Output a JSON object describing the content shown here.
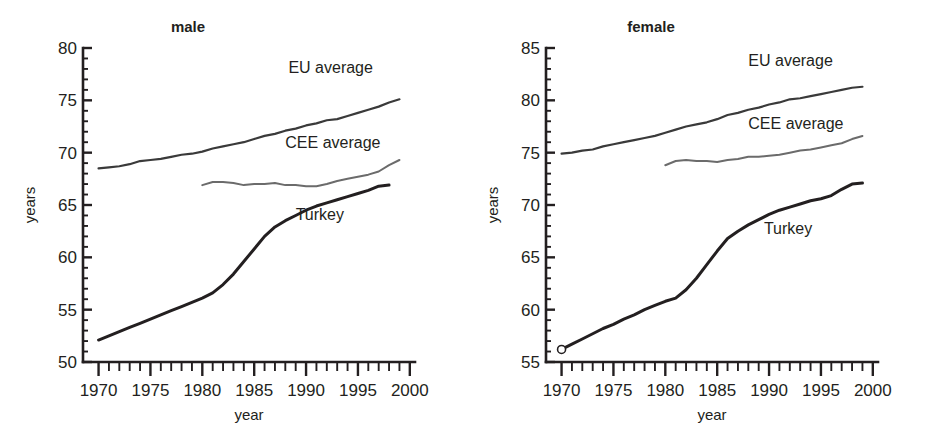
{
  "figure": {
    "background": "#ffffff",
    "ink": "#231f20"
  },
  "chart_data": [
    {
      "type": "line",
      "title": "male",
      "xlabel": "year",
      "ylabel": "years",
      "xlim": [
        1968.5,
        2000.5
      ],
      "ylim": [
        50,
        80
      ],
      "x_ticks_major": [
        1970,
        1975,
        1980,
        1985,
        1990,
        1995,
        2000
      ],
      "x_tick_labels": [
        "1970",
        "1975",
        "1980",
        "1985",
        "1990",
        "1995",
        "2000"
      ],
      "x_tick_minor_step": 1,
      "y_ticks_major": [
        50,
        55,
        60,
        65,
        70,
        75,
        80
      ],
      "y_tick_labels": [
        "50",
        "55",
        "60",
        "65",
        "70",
        "75",
        "80"
      ],
      "y_tick_minor_step": 1,
      "grid": false,
      "legend_position": "inline-annotations",
      "series": [
        {
          "name": "EU average",
          "color": "#3a3a3a",
          "width": 2.2,
          "label_x": 1988.3,
          "label_y": 77.6,
          "x": [
            1970,
            1971,
            1972,
            1973,
            1974,
            1975,
            1976,
            1977,
            1978,
            1979,
            1980,
            1981,
            1982,
            1983,
            1984,
            1985,
            1986,
            1987,
            1988,
            1989,
            1990,
            1991,
            1992,
            1993,
            1994,
            1995,
            1996,
            1997,
            1998,
            1999
          ],
          "values": [
            68.5,
            68.6,
            68.7,
            68.9,
            69.2,
            69.3,
            69.4,
            69.6,
            69.8,
            69.9,
            70.1,
            70.4,
            70.6,
            70.8,
            71.0,
            71.3,
            71.6,
            71.8,
            72.1,
            72.3,
            72.6,
            72.8,
            73.1,
            73.2,
            73.5,
            73.8,
            74.1,
            74.4,
            74.8,
            75.1
          ]
        },
        {
          "name": "CEE average",
          "color": "#6b6b6b",
          "width": 2.0,
          "label_x": 1988.0,
          "label_y": 70.4,
          "x": [
            1980,
            1981,
            1982,
            1983,
            1984,
            1985,
            1986,
            1987,
            1988,
            1989,
            1990,
            1991,
            1992,
            1993,
            1994,
            1995,
            1996,
            1997,
            1998,
            1999
          ],
          "values": [
            66.9,
            67.2,
            67.2,
            67.1,
            66.9,
            67.0,
            67.0,
            67.1,
            66.9,
            66.9,
            66.8,
            66.8,
            67.0,
            67.3,
            67.5,
            67.7,
            67.9,
            68.2,
            68.8,
            69.3
          ]
        },
        {
          "name": "Turkey",
          "color": "#231f20",
          "width": 3.0,
          "label_x": 1989.0,
          "label_y": 63.6,
          "x": [
            1970,
            1971,
            1972,
            1973,
            1974,
            1975,
            1976,
            1977,
            1978,
            1979,
            1980,
            1981,
            1982,
            1983,
            1984,
            1985,
            1986,
            1987,
            1988,
            1989,
            1990,
            1991,
            1992,
            1993,
            1994,
            1995,
            1996,
            1997,
            1998
          ],
          "values": [
            52.1,
            52.5,
            52.9,
            53.3,
            53.7,
            54.1,
            54.5,
            54.9,
            55.3,
            55.7,
            56.1,
            56.6,
            57.4,
            58.4,
            59.6,
            60.8,
            62.0,
            62.9,
            63.5,
            64.0,
            64.5,
            64.9,
            65.2,
            65.5,
            65.8,
            66.1,
            66.4,
            66.8,
            66.9
          ]
        }
      ]
    },
    {
      "type": "line",
      "title": "female",
      "xlabel": "year",
      "ylabel": "years",
      "xlim": [
        1968.5,
        2000.5
      ],
      "ylim": [
        55,
        85
      ],
      "x_ticks_major": [
        1970,
        1975,
        1980,
        1985,
        1990,
        1995,
        2000
      ],
      "x_tick_labels": [
        "1970",
        "1975",
        "1980",
        "1985",
        "1990",
        "1995",
        "2000"
      ],
      "x_tick_minor_step": 1,
      "y_ticks_major": [
        55,
        60,
        65,
        70,
        75,
        80,
        85
      ],
      "y_tick_labels": [
        "55",
        "60",
        "65",
        "70",
        "75",
        "80",
        "85"
      ],
      "y_tick_minor_step": 1,
      "grid": false,
      "legend_position": "inline-annotations",
      "series": [
        {
          "name": "EU average",
          "color": "#3a3a3a",
          "width": 2.2,
          "label_x": 1988.0,
          "label_y": 83.3,
          "x": [
            1970,
            1971,
            1972,
            1973,
            1974,
            1975,
            1976,
            1977,
            1978,
            1979,
            1980,
            1981,
            1982,
            1983,
            1984,
            1985,
            1986,
            1987,
            1988,
            1989,
            1990,
            1991,
            1992,
            1993,
            1994,
            1995,
            1996,
            1997,
            1998,
            1999
          ],
          "values": [
            74.9,
            75.0,
            75.2,
            75.3,
            75.6,
            75.8,
            76.0,
            76.2,
            76.4,
            76.6,
            76.9,
            77.2,
            77.5,
            77.7,
            77.9,
            78.2,
            78.6,
            78.8,
            79.1,
            79.3,
            79.6,
            79.8,
            80.1,
            80.2,
            80.4,
            80.6,
            80.8,
            81.0,
            81.2,
            81.3
          ]
        },
        {
          "name": "CEE average",
          "color": "#6b6b6b",
          "width": 2.0,
          "label_x": 1988.0,
          "label_y": 77.3,
          "x": [
            1980,
            1981,
            1982,
            1983,
            1984,
            1985,
            1986,
            1987,
            1988,
            1989,
            1990,
            1991,
            1992,
            1993,
            1994,
            1995,
            1996,
            1997,
            1998,
            1999
          ],
          "values": [
            73.8,
            74.2,
            74.3,
            74.2,
            74.2,
            74.1,
            74.3,
            74.4,
            74.6,
            74.6,
            74.7,
            74.8,
            75.0,
            75.2,
            75.3,
            75.5,
            75.7,
            75.9,
            76.3,
            76.6
          ]
        },
        {
          "name": "Turkey",
          "color": "#231f20",
          "width": 3.0,
          "label_x": 1989.5,
          "label_y": 67.2,
          "start_marker": "open-circle",
          "x": [
            1970,
            1971,
            1972,
            1973,
            1974,
            1975,
            1976,
            1977,
            1978,
            1979,
            1980,
            1981,
            1982,
            1983,
            1984,
            1985,
            1986,
            1987,
            1988,
            1989,
            1990,
            1991,
            1992,
            1993,
            1994,
            1995,
            1996,
            1997,
            1998,
            1999
          ],
          "values": [
            56.2,
            56.7,
            57.2,
            57.7,
            58.2,
            58.6,
            59.1,
            59.5,
            60.0,
            60.4,
            60.8,
            61.1,
            61.9,
            63.0,
            64.3,
            65.6,
            66.8,
            67.5,
            68.1,
            68.6,
            69.1,
            69.5,
            69.8,
            70.1,
            70.4,
            70.6,
            70.9,
            71.5,
            72.0,
            72.1
          ]
        }
      ]
    }
  ]
}
